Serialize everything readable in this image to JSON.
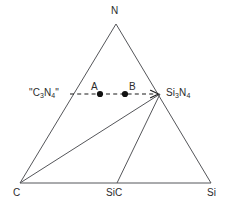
{
  "figure": {
    "type": "ternary-phase-diagram",
    "system": "C-N-Si",
    "background_color": "#ffffff",
    "line_color": "#55565a",
    "text_color": "#2b2b2b",
    "dot_color": "#111111"
  },
  "vertices": {
    "top": {
      "label": "N",
      "x": 116,
      "y": 24
    },
    "bottom_left": {
      "label": "C",
      "x": 20,
      "y": 183
    },
    "bottom_right": {
      "label": "Si",
      "x": 211,
      "y": 183
    }
  },
  "compounds": {
    "sic": {
      "label": "SiC",
      "x": 117,
      "y": 183
    },
    "si3n4": {
      "label_html": "Si<sub>3</sub>N<sub>4</sub>",
      "label_text": "Si3N4",
      "x": 160,
      "y": 94
    },
    "c3n4": {
      "label_html": "\"C<sub>3</sub>N<sub>4</sub>\"",
      "label_text": "\"C3N4\"",
      "x": 68,
      "y": 94
    }
  },
  "tie_lines": [
    {
      "name": "c-to-si3n4",
      "from": "C",
      "to": "Si3N4"
    },
    {
      "name": "sic-to-si3n4",
      "from": "SiC",
      "to": "Si3N4"
    }
  ],
  "reaction_path": {
    "name": "c3n4-to-si3n4-arrow",
    "style": "dashed-with-arrowhead",
    "start_x": 70,
    "start_y": 94,
    "end_x": 158,
    "end_y": 94
  },
  "points": [
    {
      "label": "A",
      "x": 100,
      "y": 94
    },
    {
      "label": "B",
      "x": 125,
      "y": 94
    }
  ],
  "chart_data": {
    "type": "scatter",
    "title": "",
    "xlabel": "",
    "ylabel": "",
    "annotations": [
      "N",
      "C",
      "SiC",
      "Si",
      "\"C3N4\"",
      "Si3N4",
      "A",
      "B"
    ]
  }
}
